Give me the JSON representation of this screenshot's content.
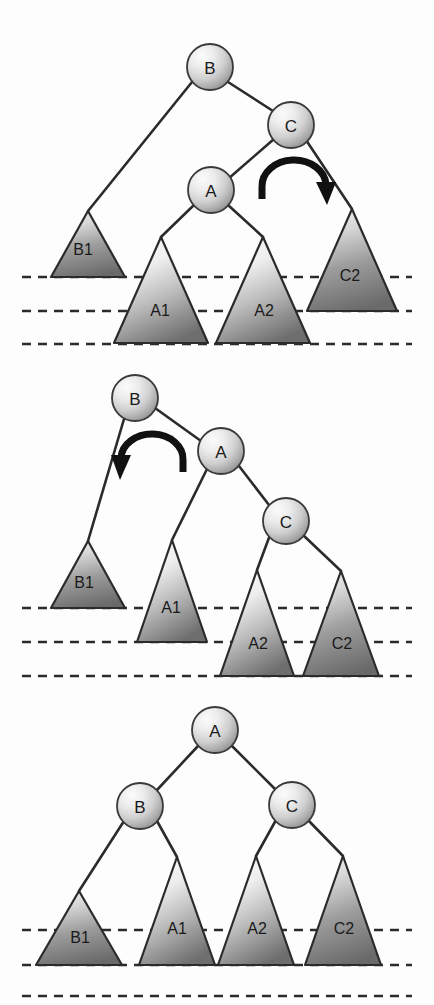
{
  "figure": {
    "background_color": "#fdfdfd",
    "ink_color": "#2b2b2b",
    "node_fill_light": "#f4f4f4",
    "node_fill_dark": "#8e8e8e",
    "triangle_fill_light": "#f2f2f2",
    "triangle_fill_dark": "#6f6f6f",
    "panel_count": 3
  },
  "panels": [
    {
      "id": "panel-before",
      "caption": "before rotation",
      "nodes": [
        {
          "label": "B",
          "cx": 210,
          "cy": 67,
          "r": 23
        },
        {
          "label": "C",
          "cx": 291,
          "cy": 125,
          "r": 23
        },
        {
          "label": "A",
          "cx": 211,
          "cy": 190,
          "r": 23
        }
      ],
      "edges": [
        {
          "from": "B",
          "to": "B1",
          "x1": 192,
          "y1": 82,
          "x2": 88,
          "y2": 211
        },
        {
          "from": "B",
          "to": "C",
          "x1": 228,
          "y1": 82,
          "x2": 273,
          "y2": 111
        },
        {
          "from": "C",
          "to": "A",
          "x1": 274,
          "y1": 139,
          "x2": 228,
          "y2": 179
        },
        {
          "from": "C",
          "to": "C2",
          "x1": 306,
          "y1": 140,
          "x2": 352,
          "y2": 209
        },
        {
          "from": "A",
          "to": "A1",
          "x1": 194,
          "y1": 205,
          "x2": 161,
          "y2": 237
        },
        {
          "from": "A",
          "to": "A2",
          "x1": 228,
          "y1": 205,
          "x2": 263,
          "y2": 237
        }
      ],
      "triangles": [
        {
          "label": "B1",
          "apex_x": 88,
          "apex_y": 211,
          "base_y": 277,
          "half_w": 37,
          "label_x": 83,
          "label_y": 249
        },
        {
          "label": "A1",
          "apex_x": 161,
          "apex_y": 237,
          "base_y": 343,
          "half_w": 47,
          "label_x": 160,
          "label_y": 310
        },
        {
          "label": "A2",
          "apex_x": 263,
          "apex_y": 237,
          "base_y": 343,
          "half_w": 47,
          "label_x": 264,
          "label_y": 310
        },
        {
          "label": "C2",
          "apex_x": 352,
          "apex_y": 209,
          "base_y": 311,
          "half_w": 45,
          "label_x": 350,
          "label_y": 275
        }
      ],
      "dashed_lines": [
        {
          "y": 277
        },
        {
          "y": 311
        },
        {
          "y": 344
        }
      ],
      "arrow": {
        "direction": "clockwise",
        "cx": 294,
        "cy": 187,
        "rx": 32,
        "ry": 26,
        "name": "rotate-right-arrow"
      }
    },
    {
      "id": "panel-middle",
      "caption": "after first rotation",
      "nodes": [
        {
          "label": "B",
          "cx": 135,
          "cy": 398,
          "r": 23
        },
        {
          "label": "A",
          "cx": 221,
          "cy": 451,
          "r": 23
        },
        {
          "label": "C",
          "cx": 286,
          "cy": 521,
          "r": 23
        }
      ],
      "edges": [
        {
          "from": "B",
          "to": "B1",
          "x1": 124,
          "y1": 419,
          "x2": 88,
          "y2": 541
        },
        {
          "from": "B",
          "to": "A",
          "x1": 155,
          "y1": 408,
          "x2": 201,
          "y2": 441
        },
        {
          "from": "A",
          "to": "A1",
          "x1": 207,
          "y1": 469,
          "x2": 172,
          "y2": 540
        },
        {
          "from": "A",
          "to": "C",
          "x1": 239,
          "y1": 466,
          "x2": 269,
          "y2": 505
        },
        {
          "from": "C",
          "to": "A2",
          "x1": 270,
          "y1": 535,
          "x2": 257,
          "y2": 570
        },
        {
          "from": "C",
          "to": "C2",
          "x1": 303,
          "y1": 535,
          "x2": 341,
          "y2": 571
        }
      ],
      "triangles": [
        {
          "label": "B1",
          "apex_x": 88,
          "apex_y": 541,
          "base_y": 608,
          "half_w": 37,
          "label_x": 84,
          "label_y": 582
        },
        {
          "label": "A1",
          "apex_x": 172,
          "apex_y": 540,
          "base_y": 642,
          "half_w": 35,
          "label_x": 171,
          "label_y": 607
        },
        {
          "label": "A2",
          "apex_x": 257,
          "apex_y": 570,
          "base_y": 676,
          "half_w": 37,
          "label_x": 258,
          "label_y": 643
        },
        {
          "label": "C2",
          "apex_x": 341,
          "apex_y": 571,
          "base_y": 676,
          "half_w": 38,
          "label_x": 342,
          "label_y": 643
        }
      ],
      "dashed_lines": [
        {
          "y": 608
        },
        {
          "y": 642
        },
        {
          "y": 676
        }
      ],
      "arrow": {
        "direction": "counter-clockwise",
        "cx": 152,
        "cy": 460,
        "rx": 31,
        "ry": 25,
        "name": "rotate-left-arrow"
      }
    },
    {
      "id": "panel-after",
      "caption": "after second rotation — balanced",
      "nodes": [
        {
          "label": "A",
          "cx": 215,
          "cy": 730,
          "r": 23
        },
        {
          "label": "B",
          "cx": 140,
          "cy": 806,
          "r": 23
        },
        {
          "label": "C",
          "cx": 292,
          "cy": 805,
          "r": 23
        }
      ],
      "edges": [
        {
          "from": "A",
          "to": "B",
          "x1": 198,
          "y1": 746,
          "x2": 157,
          "y2": 790
        },
        {
          "from": "A",
          "to": "C",
          "x1": 232,
          "y1": 746,
          "x2": 275,
          "y2": 789
        },
        {
          "from": "B",
          "to": "B1",
          "x1": 124,
          "y1": 821,
          "x2": 79,
          "y2": 891
        },
        {
          "from": "B",
          "to": "A1",
          "x1": 157,
          "y1": 821,
          "x2": 177,
          "y2": 857
        },
        {
          "from": "C",
          "to": "A2",
          "x1": 276,
          "y1": 820,
          "x2": 256,
          "y2": 856
        },
        {
          "from": "C",
          "to": "C2",
          "x1": 308,
          "y1": 820,
          "x2": 343,
          "y2": 856
        }
      ],
      "triangles": [
        {
          "label": "B1",
          "apex_x": 79,
          "apex_y": 891,
          "base_y": 965,
          "half_w": 43,
          "label_x": 80,
          "label_y": 937
        },
        {
          "label": "A1",
          "apex_x": 177,
          "apex_y": 857,
          "base_y": 965,
          "half_w": 38,
          "label_x": 177,
          "label_y": 928
        },
        {
          "label": "A2",
          "apex_x": 256,
          "apex_y": 856,
          "base_y": 965,
          "half_w": 38,
          "label_x": 257,
          "label_y": 928
        },
        {
          "label": "C2",
          "apex_x": 343,
          "apex_y": 856,
          "base_y": 965,
          "half_w": 38,
          "label_x": 344,
          "label_y": 928
        }
      ],
      "dashed_lines": [
        {
          "y": 930
        },
        {
          "y": 965
        },
        {
          "y": 996
        }
      ],
      "arrow": null
    }
  ],
  "dash_extent": {
    "x_start": 22,
    "x_end": 412
  }
}
